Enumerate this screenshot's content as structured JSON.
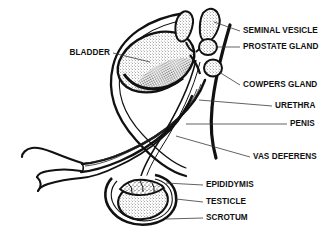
{
  "diagram": {
    "style": "black-and-white line art with stipple shading",
    "background_color": "#ffffff",
    "ink_color": "#111111",
    "leader_color": "#3a3a3a"
  },
  "labels": {
    "bladder": "BLADDER",
    "seminal_vesicle": "SEMINAL VESICLE",
    "prostate_gland": "PROSTATE GLAND",
    "cowpers_gland": "COWPERS GLAND",
    "urethra": "URETHRA",
    "penis": "PENIS",
    "vas_deferens": "VAS DEFERENS",
    "epididymis": "EPIDIDYMIS",
    "testicle": "TESTICLE",
    "scrotum": "SCROTUM"
  },
  "label_list": [
    {
      "id": "bladder",
      "text": "BLADDER",
      "side": "left",
      "x": 110,
      "y": 53
    },
    {
      "id": "seminal-vesicle",
      "text": "SEMINAL VESICLE",
      "side": "right",
      "x": 243,
      "y": 31
    },
    {
      "id": "prostate-gland",
      "text": "PROSTATE GLAND",
      "side": "right",
      "x": 243,
      "y": 47
    },
    {
      "id": "cowpers-gland",
      "text": "COWPERS GLAND",
      "side": "right",
      "x": 243,
      "y": 85
    },
    {
      "id": "urethra",
      "text": "URETHRA",
      "side": "right",
      "x": 275,
      "y": 106
    },
    {
      "id": "penis",
      "text": "PENIS",
      "side": "right",
      "x": 290,
      "y": 124
    },
    {
      "id": "vas-deferens",
      "text": "VAS DEFERENS",
      "side": "right",
      "x": 253,
      "y": 157
    },
    {
      "id": "epididymis",
      "text": "EPIDIDYMIS",
      "side": "right",
      "x": 206,
      "y": 185
    },
    {
      "id": "testicle",
      "text": "TESTICLE",
      "side": "right",
      "x": 206,
      "y": 202
    },
    {
      "id": "scrotum",
      "text": "SCROTUM",
      "side": "right",
      "x": 206,
      "y": 218
    }
  ]
}
